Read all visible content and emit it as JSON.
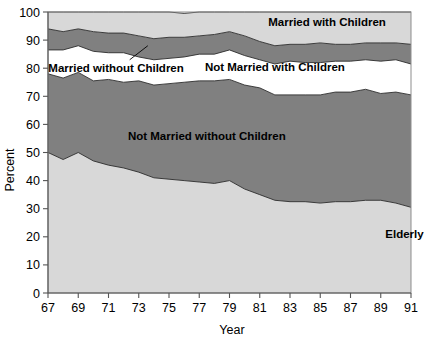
{
  "chart_data": {
    "type": "area",
    "stacked": true,
    "title": "",
    "subtitle": "",
    "xlabel": "Year",
    "ylabel": "Percent",
    "ylim": [
      0,
      100
    ],
    "xlim": [
      67,
      91
    ],
    "grid": false,
    "legend_position": "inline-labels",
    "x": [
      67,
      68,
      69,
      70,
      71,
      72,
      73,
      74,
      75,
      76,
      77,
      78,
      79,
      80,
      81,
      82,
      83,
      84,
      85,
      86,
      87,
      88,
      89,
      90,
      91
    ],
    "xtick_labels": [
      "67",
      "69",
      "71",
      "73",
      "75",
      "77",
      "79",
      "81",
      "83",
      "85",
      "87",
      "89",
      "91"
    ],
    "xticks": [
      67,
      69,
      71,
      73,
      75,
      77,
      79,
      81,
      83,
      85,
      87,
      89,
      91
    ],
    "ytick_labels": [
      "0",
      "10",
      "20",
      "30",
      "40",
      "50",
      "60",
      "70",
      "80",
      "90",
      "100"
    ],
    "yticks": [
      0,
      10,
      20,
      30,
      40,
      50,
      60,
      70,
      80,
      90,
      100
    ],
    "series": [
      {
        "name": "Elderly",
        "color": "#d8d8d8",
        "label_x": 88.0,
        "label_y": 21.0,
        "values": [
          50.0,
          47.5,
          50.0,
          47.0,
          45.5,
          44.5,
          43.0,
          41.0,
          40.5,
          40.0,
          39.5,
          39.0,
          40.0,
          37.0,
          35.0,
          33.0,
          32.5,
          32.5,
          32.0,
          32.5,
          32.5,
          33.0,
          33.0,
          32.0,
          30.5
        ]
      },
      {
        "name": "Not Married without Children",
        "color": "#808080",
        "label_x": 77.5,
        "label_y": 56.0,
        "values": [
          28.0,
          29.0,
          28.5,
          28.5,
          30.5,
          30.5,
          32.5,
          33.0,
          34.0,
          35.0,
          36.0,
          36.5,
          36.0,
          37.0,
          38.0,
          37.5,
          38.0,
          38.0,
          38.5,
          39.0,
          39.0,
          39.5,
          38.0,
          39.5,
          40.0
        ]
      },
      {
        "name": "Not Married with Children",
        "color": "#ffffff",
        "label_x": 82.0,
        "label_y": 80.5,
        "values": [
          8.5,
          10.0,
          9.5,
          10.5,
          9.5,
          10.5,
          8.5,
          9.0,
          9.0,
          9.0,
          9.5,
          9.5,
          10.5,
          10.5,
          10.0,
          11.0,
          12.0,
          11.5,
          11.5,
          11.0,
          11.0,
          10.5,
          11.5,
          11.5,
          11.0
        ]
      },
      {
        "name": "Married without Children",
        "color": "#808080",
        "label_x": 71.5,
        "label_y": 80.0,
        "values": [
          7.5,
          6.5,
          6.0,
          7.0,
          7.0,
          7.0,
          7.5,
          7.5,
          7.5,
          7.0,
          6.5,
          7.0,
          6.5,
          7.0,
          6.5,
          6.5,
          6.0,
          6.5,
          7.0,
          6.0,
          6.0,
          6.0,
          6.5,
          6.0,
          7.0
        ]
      },
      {
        "name": "Married with Children",
        "color": "#d8d8d8",
        "label_x": 85.5,
        "label_y": 96.5,
        "values": [
          6.0,
          7.0,
          6.0,
          7.0,
          7.5,
          7.5,
          8.5,
          9.5,
          9.0,
          8.5,
          8.5,
          8.0,
          7.0,
          8.5,
          10.5,
          12.0,
          11.5,
          11.5,
          11.0,
          11.5,
          11.5,
          11.0,
          11.0,
          11.0,
          11.5
        ]
      }
    ],
    "leader_annotation": {
      "from_series": "Married without Children",
      "label_anchor_x": 72.4,
      "label_anchor_y": 83.0,
      "target_x": 73.6,
      "target_y": 88.0
    }
  },
  "axes": {
    "y_title": "Percent",
    "x_title": "Year"
  }
}
